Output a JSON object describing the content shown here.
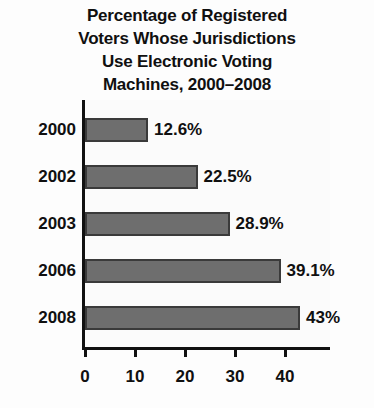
{
  "chart_data": {
    "type": "bar",
    "orientation": "horizontal",
    "title": "Percentage of Registered Voters Whose Jurisdictions Use Electronic Voting Machines, 2000–2008",
    "title_lines": [
      "Percentage of Registered",
      "Voters Whose Jurisdictions",
      "Use Electronic Voting",
      "Machines, 2000–2008"
    ],
    "categories": [
      "2000",
      "2002",
      "2003",
      "2006",
      "2008"
    ],
    "values": [
      12.6,
      22.5,
      28.9,
      39.1,
      43
    ],
    "data_labels": [
      "12.6%",
      "22.5%",
      "28.9%",
      "39.1%",
      "43%"
    ],
    "xlabel": "",
    "ylabel": "",
    "xlim": [
      0,
      49
    ],
    "xticks": [
      0,
      10,
      20,
      30,
      40
    ],
    "xtick_labels": [
      "0",
      "10",
      "20",
      "30",
      "40"
    ],
    "grid": false,
    "legend": null,
    "bar_color": "#6e6e6e",
    "bar_edge_color": "#3a3a3a",
    "axis_color": "#111111",
    "background_color": "#fbfbfb",
    "text_color": "#101010"
  }
}
